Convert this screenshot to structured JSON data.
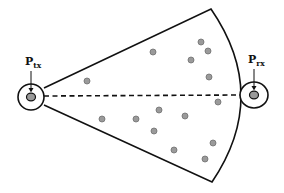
{
  "diagram": {
    "type": "antenna-sector-scattering",
    "colors": {
      "stroke": "#111111",
      "scatterer_fill": "#9a9a9a",
      "scatterer_stroke": "#6e6e6e",
      "background": "#ffffff"
    },
    "transmitter": {
      "label_main": "P",
      "label_sub": "tx",
      "center": [
        31,
        97
      ],
      "rx": 13,
      "ry": 13
    },
    "receiver": {
      "label_main": "P",
      "label_sub": "rx",
      "center": [
        254,
        95
      ],
      "rx": 14,
      "ry": 13
    },
    "sector": {
      "apex_top": [
        44,
        88
      ],
      "apex_bottom": [
        44,
        105
      ],
      "corner_top": [
        211,
        9
      ],
      "corner_bottom": [
        212,
        182
      ],
      "arc_bulge_x": 241
    },
    "line_of_sight": {
      "style": "dashed",
      "from": [
        44,
        96
      ],
      "to": [
        240,
        95
      ]
    },
    "scatterers": [
      [
        87,
        81
      ],
      [
        153,
        52
      ],
      [
        201,
        42
      ],
      [
        208,
        51
      ],
      [
        191,
        60
      ],
      [
        209,
        77
      ],
      [
        218,
        102
      ],
      [
        159,
        110
      ],
      [
        185,
        116
      ],
      [
        102,
        119
      ],
      [
        136,
        119
      ],
      [
        154,
        131
      ],
      [
        213,
        143
      ],
      [
        174,
        150
      ],
      [
        205,
        159
      ]
    ]
  }
}
